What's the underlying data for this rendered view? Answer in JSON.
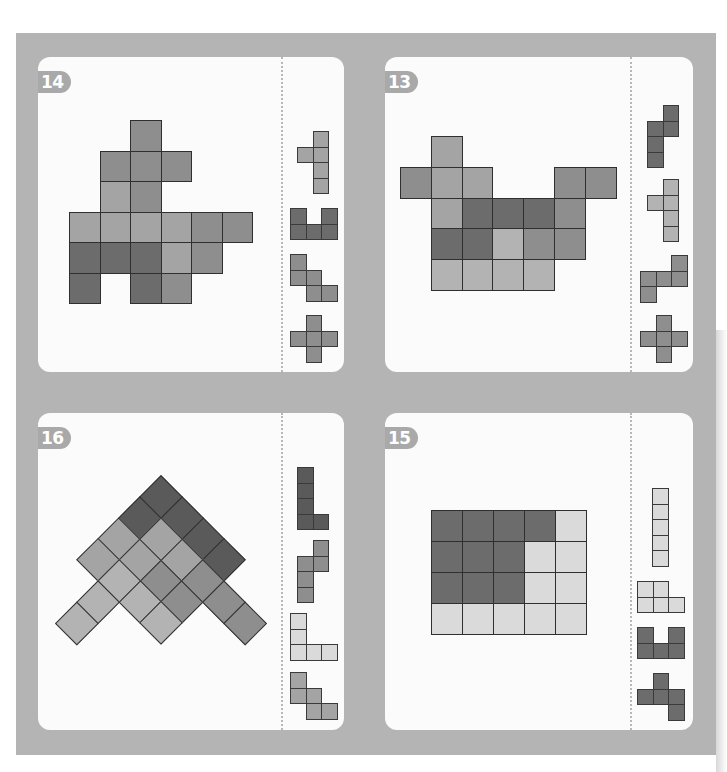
{
  "page": {
    "colors": {
      "board": "#b4b4b4",
      "card": "#fbfbfb",
      "badge": "#a9a9a9",
      "dark": "#6c6c6c",
      "darker": "#5a5a5a",
      "medium": "#8e8e8e",
      "midlight": "#a4a4a4",
      "light": "#b3b3b3",
      "lighter": "#dadada"
    }
  },
  "puzzles": [
    {
      "id": "p14",
      "number": "14",
      "card": {
        "left": 38,
        "top": 57,
        "width": 306,
        "height": 315
      },
      "divider_x": 243,
      "grid": {
        "left": 31,
        "top": 63,
        "cell": 30.5,
        "type": "square"
      },
      "cells": [
        {
          "r": 0,
          "c": 2,
          "shade": "medium"
        },
        {
          "r": 1,
          "c": 1,
          "shade": "medium"
        },
        {
          "r": 1,
          "c": 2,
          "shade": "medium"
        },
        {
          "r": 1,
          "c": 3,
          "shade": "medium"
        },
        {
          "r": 2,
          "c": 1,
          "shade": "midlight"
        },
        {
          "r": 2,
          "c": 2,
          "shade": "medium"
        },
        {
          "r": 3,
          "c": 0,
          "shade": "midlight"
        },
        {
          "r": 3,
          "c": 1,
          "shade": "midlight"
        },
        {
          "r": 3,
          "c": 2,
          "shade": "midlight"
        },
        {
          "r": 3,
          "c": 3,
          "shade": "midlight"
        },
        {
          "r": 3,
          "c": 4,
          "shade": "medium"
        },
        {
          "r": 3,
          "c": 5,
          "shade": "medium"
        },
        {
          "r": 4,
          "c": 0,
          "shade": "dark"
        },
        {
          "r": 4,
          "c": 1,
          "shade": "dark"
        },
        {
          "r": 4,
          "c": 2,
          "shade": "dark"
        },
        {
          "r": 4,
          "c": 3,
          "shade": "midlight"
        },
        {
          "r": 4,
          "c": 4,
          "shade": "medium"
        },
        {
          "r": 5,
          "c": 0,
          "shade": "dark"
        },
        {
          "r": 5,
          "c": 2,
          "shade": "dark"
        },
        {
          "r": 5,
          "c": 3,
          "shade": "medium"
        }
      ],
      "pieces": [
        {
          "name": "y-pentomino",
          "left": 259,
          "top": 74,
          "cell": 15.5,
          "shade": "midlight",
          "cells": [
            [
              0,
              1
            ],
            [
              1,
              0
            ],
            [
              1,
              1
            ],
            [
              2,
              1
            ],
            [
              3,
              1
            ]
          ]
        },
        {
          "name": "u-pentomino",
          "left": 252,
          "top": 151,
          "cell": 15.5,
          "shade": "dark",
          "cells": [
            [
              0,
              0
            ],
            [
              0,
              2
            ],
            [
              1,
              0
            ],
            [
              1,
              1
            ],
            [
              1,
              2
            ]
          ]
        },
        {
          "name": "w-pentomino",
          "left": 252,
          "top": 197,
          "cell": 15.5,
          "shade": "medium",
          "cells": [
            [
              0,
              0
            ],
            [
              1,
              0
            ],
            [
              1,
              1
            ],
            [
              2,
              1
            ],
            [
              2,
              2
            ]
          ]
        },
        {
          "name": "x-pentomino",
          "left": 252,
          "top": 258,
          "cell": 15.5,
          "shade": "medium",
          "cells": [
            [
              0,
              1
            ],
            [
              1,
              0
            ],
            [
              1,
              1
            ],
            [
              1,
              2
            ],
            [
              2,
              1
            ]
          ]
        }
      ]
    },
    {
      "id": "p13",
      "number": "13",
      "card": {
        "left": 385,
        "top": 57,
        "width": 308,
        "height": 315
      },
      "divider_x": 245,
      "grid": {
        "left": 15,
        "top": 79,
        "cell": 30.8,
        "type": "square"
      },
      "cells": [
        {
          "r": 0,
          "c": 1,
          "shade": "midlight"
        },
        {
          "r": 1,
          "c": 0,
          "shade": "medium"
        },
        {
          "r": 1,
          "c": 1,
          "shade": "midlight"
        },
        {
          "r": 1,
          "c": 2,
          "shade": "midlight"
        },
        {
          "r": 1,
          "c": 5,
          "shade": "medium"
        },
        {
          "r": 1,
          "c": 6,
          "shade": "medium"
        },
        {
          "r": 2,
          "c": 1,
          "shade": "midlight"
        },
        {
          "r": 2,
          "c": 2,
          "shade": "dark"
        },
        {
          "r": 2,
          "c": 3,
          "shade": "dark"
        },
        {
          "r": 2,
          "c": 4,
          "shade": "dark"
        },
        {
          "r": 2,
          "c": 5,
          "shade": "medium"
        },
        {
          "r": 3,
          "c": 1,
          "shade": "dark"
        },
        {
          "r": 3,
          "c": 2,
          "shade": "dark"
        },
        {
          "r": 3,
          "c": 3,
          "shade": "light"
        },
        {
          "r": 3,
          "c": 4,
          "shade": "medium"
        },
        {
          "r": 3,
          "c": 5,
          "shade": "medium"
        },
        {
          "r": 4,
          "c": 1,
          "shade": "light"
        },
        {
          "r": 4,
          "c": 2,
          "shade": "light"
        },
        {
          "r": 4,
          "c": 3,
          "shade": "light"
        },
        {
          "r": 4,
          "c": 4,
          "shade": "light"
        }
      ],
      "pieces": [
        {
          "name": "n-pentomino",
          "left": 262,
          "top": 48,
          "cell": 15.5,
          "shade": "dark",
          "cells": [
            [
              0,
              1
            ],
            [
              1,
              0
            ],
            [
              1,
              1
            ],
            [
              2,
              0
            ],
            [
              3,
              0
            ]
          ]
        },
        {
          "name": "y-pentomino",
          "left": 262,
          "top": 122,
          "cell": 15.5,
          "shade": "light",
          "cells": [
            [
              0,
              1
            ],
            [
              1,
              0
            ],
            [
              1,
              1
            ],
            [
              2,
              1
            ],
            [
              3,
              1
            ]
          ]
        },
        {
          "name": "s-pentomino",
          "left": 255,
          "top": 198,
          "cell": 15.5,
          "shade": "medium",
          "cells": [
            [
              0,
              2
            ],
            [
              1,
              0
            ],
            [
              1,
              1
            ],
            [
              1,
              2
            ],
            [
              2,
              0
            ]
          ]
        },
        {
          "name": "x-pentomino",
          "left": 255,
          "top": 258,
          "cell": 15.5,
          "shade": "medium",
          "cells": [
            [
              0,
              1
            ],
            [
              1,
              0
            ],
            [
              1,
              1
            ],
            [
              1,
              2
            ],
            [
              2,
              1
            ]
          ]
        }
      ]
    },
    {
      "id": "p16",
      "number": "16",
      "card": {
        "left": 38,
        "top": 413,
        "width": 306,
        "height": 317
      },
      "divider_x": 243,
      "grid": {
        "apex_x": 123,
        "apex_y": 62,
        "cell": 29.8,
        "type": "diamond"
      },
      "cells": [
        {
          "a": 0,
          "b": 0,
          "shade": "darker"
        },
        {
          "a": 1,
          "b": 0,
          "shade": "darker"
        },
        {
          "a": 2,
          "b": 0,
          "shade": "darker"
        },
        {
          "a": 3,
          "b": 0,
          "shade": "darker"
        },
        {
          "a": 0,
          "b": 1,
          "shade": "darker"
        },
        {
          "a": 0,
          "b": 2,
          "shade": "midlight"
        },
        {
          "a": 0,
          "b": 3,
          "shade": "midlight"
        },
        {
          "a": 1,
          "b": 1,
          "shade": "midlight"
        },
        {
          "a": 1,
          "b": 2,
          "shade": "midlight"
        },
        {
          "a": 2,
          "b": 1,
          "shade": "midlight"
        },
        {
          "a": 2,
          "b": 2,
          "shade": "medium"
        },
        {
          "a": 3,
          "b": 1,
          "shade": "medium"
        },
        {
          "a": 3,
          "b": 2,
          "shade": "medium"
        },
        {
          "a": 4,
          "b": 1,
          "shade": "medium"
        },
        {
          "a": 5,
          "b": 1,
          "shade": "medium"
        },
        {
          "a": 1,
          "b": 3,
          "shade": "light"
        },
        {
          "a": 1,
          "b": 4,
          "shade": "light"
        },
        {
          "a": 1,
          "b": 5,
          "shade": "light"
        },
        {
          "a": 2,
          "b": 3,
          "shade": "light"
        },
        {
          "a": 3,
          "b": 3,
          "shade": "light"
        }
      ],
      "pieces": [
        {
          "name": "l-pentomino",
          "left": 259,
          "top": 54,
          "cell": 15.5,
          "shade": "darker",
          "cells": [
            [
              0,
              0
            ],
            [
              1,
              0
            ],
            [
              2,
              0
            ],
            [
              3,
              0
            ],
            [
              3,
              1
            ]
          ]
        },
        {
          "name": "n-pentomino",
          "left": 259,
          "top": 127,
          "cell": 15.5,
          "shade": "medium",
          "cells": [
            [
              0,
              1
            ],
            [
              1,
              0
            ],
            [
              1,
              1
            ],
            [
              2,
              0
            ],
            [
              3,
              0
            ]
          ]
        },
        {
          "name": "v-pentomino",
          "left": 252,
          "top": 200,
          "cell": 15.5,
          "shade": "lighter",
          "cells": [
            [
              0,
              0
            ],
            [
              1,
              0
            ],
            [
              2,
              0
            ],
            [
              2,
              1
            ],
            [
              2,
              2
            ]
          ]
        },
        {
          "name": "w-pentomino",
          "left": 252,
          "top": 259,
          "cell": 15.5,
          "shade": "midlight",
          "cells": [
            [
              0,
              0
            ],
            [
              1,
              0
            ],
            [
              1,
              1
            ],
            [
              2,
              1
            ],
            [
              2,
              2
            ]
          ]
        }
      ]
    },
    {
      "id": "p15",
      "number": "15",
      "card": {
        "left": 385,
        "top": 413,
        "width": 308,
        "height": 317
      },
      "divider_x": 245,
      "grid": {
        "left": 46,
        "top": 97,
        "cell": 31,
        "type": "square"
      },
      "cells": [
        {
          "r": 0,
          "c": 0,
          "shade": "dark"
        },
        {
          "r": 0,
          "c": 1,
          "shade": "dark"
        },
        {
          "r": 0,
          "c": 2,
          "shade": "dark"
        },
        {
          "r": 0,
          "c": 3,
          "shade": "dark"
        },
        {
          "r": 0,
          "c": 4,
          "shade": "lighter"
        },
        {
          "r": 1,
          "c": 0,
          "shade": "dark"
        },
        {
          "r": 1,
          "c": 1,
          "shade": "dark"
        },
        {
          "r": 1,
          "c": 2,
          "shade": "dark"
        },
        {
          "r": 1,
          "c": 3,
          "shade": "lighter"
        },
        {
          "r": 1,
          "c": 4,
          "shade": "lighter"
        },
        {
          "r": 2,
          "c": 0,
          "shade": "dark"
        },
        {
          "r": 2,
          "c": 1,
          "shade": "dark"
        },
        {
          "r": 2,
          "c": 2,
          "shade": "dark"
        },
        {
          "r": 2,
          "c": 3,
          "shade": "lighter"
        },
        {
          "r": 2,
          "c": 4,
          "shade": "lighter"
        },
        {
          "r": 3,
          "c": 0,
          "shade": "lighter"
        },
        {
          "r": 3,
          "c": 1,
          "shade": "lighter"
        },
        {
          "r": 3,
          "c": 2,
          "shade": "lighter"
        },
        {
          "r": 3,
          "c": 3,
          "shade": "lighter"
        },
        {
          "r": 3,
          "c": 4,
          "shade": "lighter"
        }
      ],
      "pieces": [
        {
          "name": "i-pentomino",
          "left": 267,
          "top": 75,
          "cell": 15.5,
          "shade": "lighter",
          "cells": [
            [
              0,
              0
            ],
            [
              1,
              0
            ],
            [
              2,
              0
            ],
            [
              3,
              0
            ],
            [
              4,
              0
            ]
          ]
        },
        {
          "name": "p-pentomino",
          "left": 252,
          "top": 168,
          "cell": 15.5,
          "shade": "lighter",
          "cells": [
            [
              0,
              0
            ],
            [
              0,
              1
            ],
            [
              1,
              0
            ],
            [
              1,
              1
            ],
            [
              1,
              2
            ]
          ]
        },
        {
          "name": "u-pentomino",
          "left": 252,
          "top": 214,
          "cell": 15.5,
          "shade": "dark",
          "cells": [
            [
              0,
              0
            ],
            [
              0,
              2
            ],
            [
              1,
              0
            ],
            [
              1,
              1
            ],
            [
              1,
              2
            ]
          ]
        },
        {
          "name": "f-pentomino",
          "left": 252,
          "top": 260,
          "cell": 15.5,
          "shade": "dark",
          "cells": [
            [
              0,
              1
            ],
            [
              1,
              0
            ],
            [
              1,
              1
            ],
            [
              1,
              2
            ],
            [
              2,
              2
            ]
          ]
        }
      ]
    }
  ]
}
